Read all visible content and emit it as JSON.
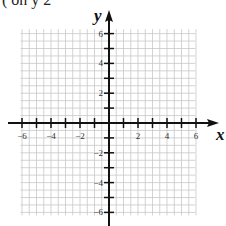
{
  "header": {
    "partial_text": "( on  y 2 "
  },
  "graph": {
    "x_axis_label": "x",
    "y_axis_label": "y",
    "x_range": [
      -6,
      6
    ],
    "y_range": [
      -6,
      6
    ],
    "grid_step": 1,
    "x_tick_labels": [
      "-6",
      "-4",
      "-2",
      "2",
      "4",
      "6"
    ],
    "y_tick_labels": [
      "6",
      "4",
      "2",
      "-2",
      "-4",
      "-6"
    ],
    "colors": {
      "grid": "#c8c8c8",
      "axis": "#111111",
      "label": "#333333"
    }
  }
}
